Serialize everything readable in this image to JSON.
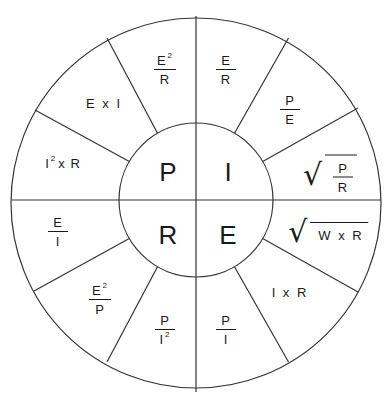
{
  "diagram": {
    "center_quadrants": [
      {
        "id": "power",
        "letter": "P"
      },
      {
        "id": "current",
        "letter": "I"
      },
      {
        "id": "voltage",
        "letter": "E"
      },
      {
        "id": "resistance",
        "letter": "R"
      }
    ],
    "segments": {
      "current_e_over_r": {
        "num": "E",
        "den": "R"
      },
      "current_p_over_e": {
        "num": "P",
        "den": "E"
      },
      "current_sqrt_p_over_r": {
        "radical": "√",
        "num": "P",
        "den": "R"
      },
      "voltage_sqrt_w_x_r": {
        "radical": "√",
        "expr": "W x R"
      },
      "voltage_i_x_r": {
        "expr": "I x R"
      },
      "voltage_p_over_i": {
        "num": "P",
        "den": "I"
      },
      "resistance_p_over_i2": {
        "num": "P",
        "den": "I",
        "den_sup": "2"
      },
      "resistance_e2_over_p": {
        "num": "E",
        "num_sup": "2",
        "den": "P"
      },
      "resistance_e_over_i": {
        "num": "E",
        "den": "I"
      },
      "power_i2_x_r": {
        "base": "I",
        "sup": "2",
        "rest": "x R"
      },
      "power_e_x_i": {
        "expr": "E x I"
      },
      "power_e2_over_r": {
        "num": "E",
        "num_sup": "2",
        "den": "R"
      }
    },
    "colors": {
      "line": "#333333",
      "text": "#1a1a1a",
      "background": "#ffffff"
    }
  }
}
